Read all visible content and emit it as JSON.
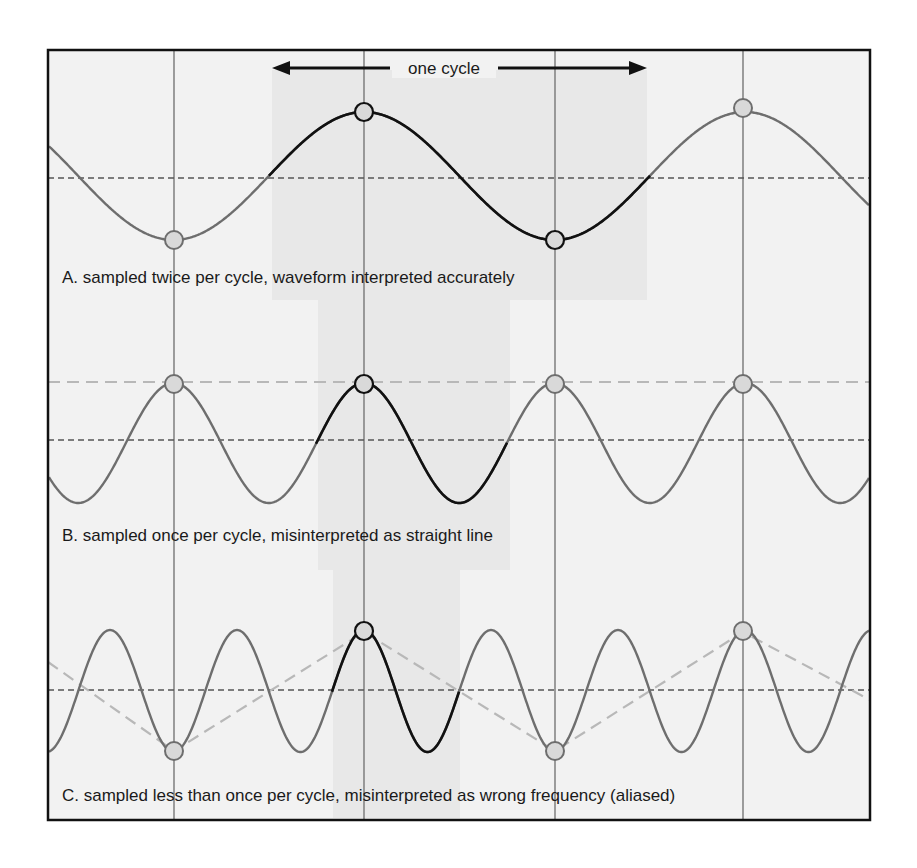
{
  "figure": {
    "title_arrow_label": "one cycle",
    "panels": [
      {
        "id": "A",
        "caption": "A. sampled twice per cycle, waveform interpreted accurately"
      },
      {
        "id": "B",
        "caption": "B. sampled once per cycle, misinterpreted as straight line"
      },
      {
        "id": "C",
        "caption": "C. sampled less than once per cycle, misinterpreted as wrong frequency (aliased)"
      }
    ],
    "colors": {
      "frame": "#111111",
      "background": "#f1f1f1",
      "highlight_band": "#e6e6e6",
      "wave_gray": "#6e6e6e",
      "wave_black": "#111111",
      "sample_fill": "#d9d9d9",
      "alias_dash": "#b8b8b8"
    },
    "sample_x_positions": [
      174,
      364,
      555,
      743
    ]
  }
}
